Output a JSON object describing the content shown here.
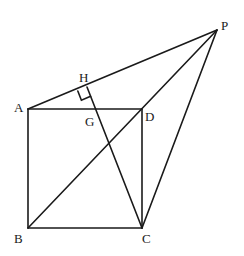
{
  "figure": {
    "points": {
      "A": {
        "label": "A",
        "x": 28,
        "y": 109
      },
      "B": {
        "label": "B",
        "x": 28,
        "y": 228
      },
      "C": {
        "label": "C",
        "x": 142,
        "y": 228
      },
      "D": {
        "label": "D",
        "x": 142,
        "y": 109
      },
      "P": {
        "label": "P",
        "x": 217,
        "y": 30
      },
      "H": {
        "label": "H",
        "x": 87,
        "y": 87
      },
      "G": {
        "label": "G",
        "x": 97,
        "y": 109
      }
    },
    "segments": [
      [
        "A",
        "B"
      ],
      [
        "B",
        "C"
      ],
      [
        "C",
        "D"
      ],
      [
        "D",
        "A"
      ],
      [
        "A",
        "P"
      ],
      [
        "B",
        "P"
      ],
      [
        "C",
        "P"
      ],
      [
        "H",
        "C"
      ]
    ],
    "right_angle_at": "H",
    "labels": {
      "A": "A",
      "B": "B",
      "C": "C",
      "D": "D",
      "P": "P",
      "H": "H",
      "G": "G"
    }
  }
}
